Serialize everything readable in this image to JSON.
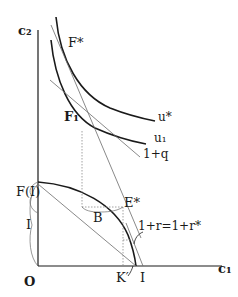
{
  "diagram": {
    "axes": {
      "y_label": "c₂",
      "x_label": "c₁",
      "origin_label": "O"
    },
    "points": {
      "f_star": "F*",
      "f1": "F₁",
      "e_star": "E*",
      "b": "B",
      "k_prime": "K′",
      "i_axis": "I"
    },
    "curves": {
      "u_star": "u*",
      "u1": "u₁",
      "slope_q": "1+q",
      "slope_r": "1+r=1+r*"
    },
    "brackets": {
      "f_of_i": "F(I)",
      "i_vertical": "I"
    },
    "colors": {
      "ink": "#1a1a1a",
      "thin_line": "#6b6b6b",
      "dotted": "#8a8a8a"
    }
  }
}
